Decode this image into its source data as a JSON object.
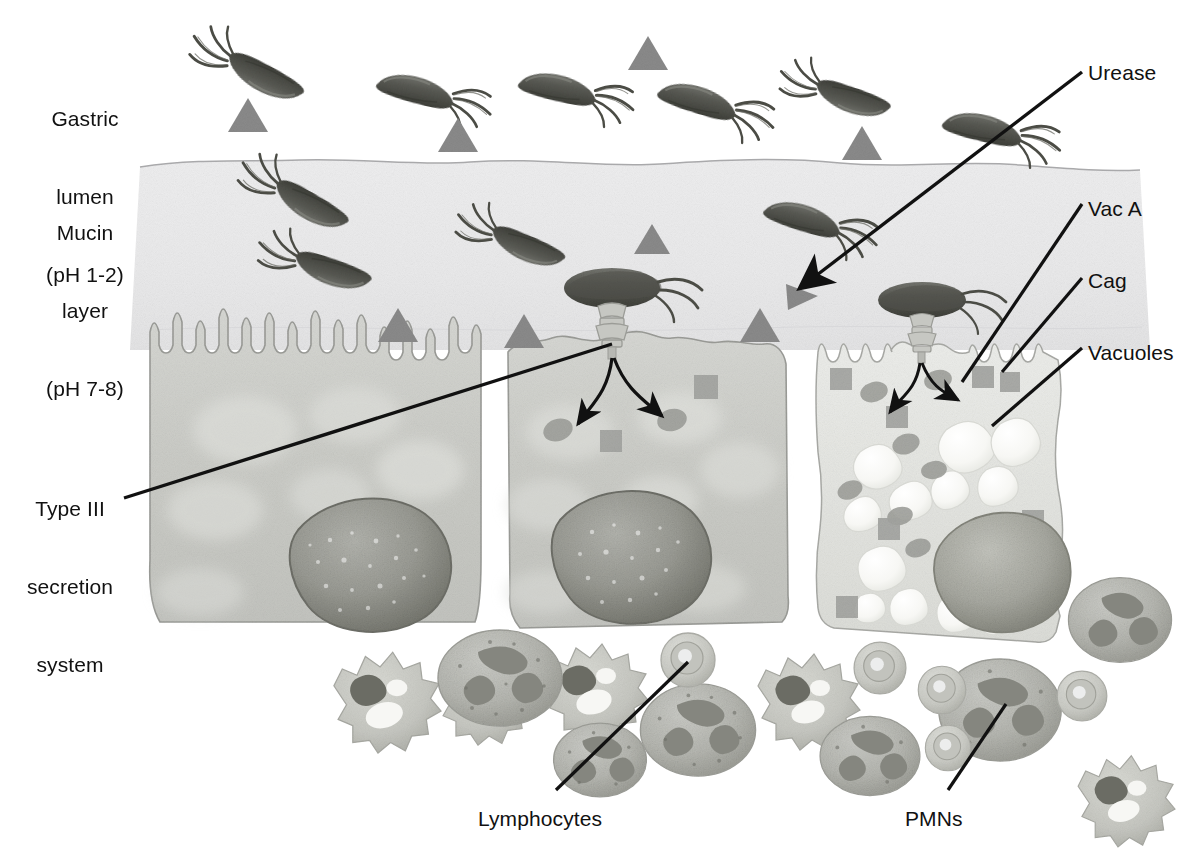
{
  "figure": {
    "type": "biomedical-illustration",
    "background_color": "#ffffff",
    "ink_color": "#111111"
  },
  "region_labels": [
    {
      "id": "gastric-lumen",
      "lines": [
        "Gastric",
        "lumen",
        "(pH 1-2)"
      ],
      "x": 84,
      "y": 54,
      "align": "center",
      "ph": "1-2"
    },
    {
      "id": "mucin-layer",
      "lines": [
        "Mucin",
        "layer",
        "(pH 7-8)"
      ],
      "x": 84,
      "y": 168,
      "align": "center",
      "ph": "7-8"
    }
  ],
  "callouts": [
    {
      "id": "urease",
      "label": "Urease",
      "x": 1088,
      "y": 60,
      "align": "left",
      "target": "urease-triangle"
    },
    {
      "id": "vac-a",
      "label": "Vac A",
      "x": 1088,
      "y": 196,
      "align": "left",
      "target": "vac-a-granule"
    },
    {
      "id": "cag",
      "label": "Cag",
      "x": 1088,
      "y": 268,
      "align": "left",
      "target": "cag-square"
    },
    {
      "id": "vacuoles",
      "label": "Vacuoles",
      "x": 1088,
      "y": 340,
      "align": "left",
      "target": "vacuole-cluster"
    },
    {
      "id": "type-iii",
      "label": "Type III\nsecretion\nsystem",
      "x": 16,
      "y": 444,
      "align": "left",
      "target": "t3ss-needle"
    },
    {
      "id": "lymphocytes",
      "label": "Lymphocytes",
      "x": 478,
      "y": 806,
      "align": "left",
      "target": "lymphocyte-cell"
    },
    {
      "id": "pmns",
      "label": "PMNs",
      "x": 905,
      "y": 806,
      "align": "left",
      "target": "pmn-cell"
    }
  ],
  "legend_semantics": {
    "triangle": "Urease enzyme",
    "square": "Cag protein",
    "ellipse": "Vac A toxin",
    "white_blob": "Vacuole"
  },
  "palette": {
    "mucin_fill": "#ededee",
    "mucin_edge": "#9a9a9c",
    "cell_fill": "#cfd0cd",
    "cell_fill_damaged": "#e6e7e4",
    "cell_edge": "#9b9c98",
    "nucleus": "#9a9b96",
    "nucleus_edge": "#6f7069",
    "bacterium": "#5e5f5b",
    "bacterium_dark": "#46473f",
    "triangle": "#8a8a8a",
    "square": "#a2a3a0",
    "granule": "#9a9b96",
    "vacuole": "#fbfbf9",
    "pmn_fill": "#b9bab5",
    "pmn_nucleus": "#85867f",
    "lympho_fill": "#cdcec9",
    "macro_fill": "#c8c9c3",
    "macro_nucleus": "#6b6c64",
    "leader": "#111111"
  },
  "counts": {
    "bacteria_lumen": 6,
    "bacteria_mucin": 5,
    "bacteria_attached": 2,
    "epithelial_cells": 3,
    "triangles": 11,
    "pmns": 6,
    "lymphocytes": 6,
    "macrophages": 5
  }
}
